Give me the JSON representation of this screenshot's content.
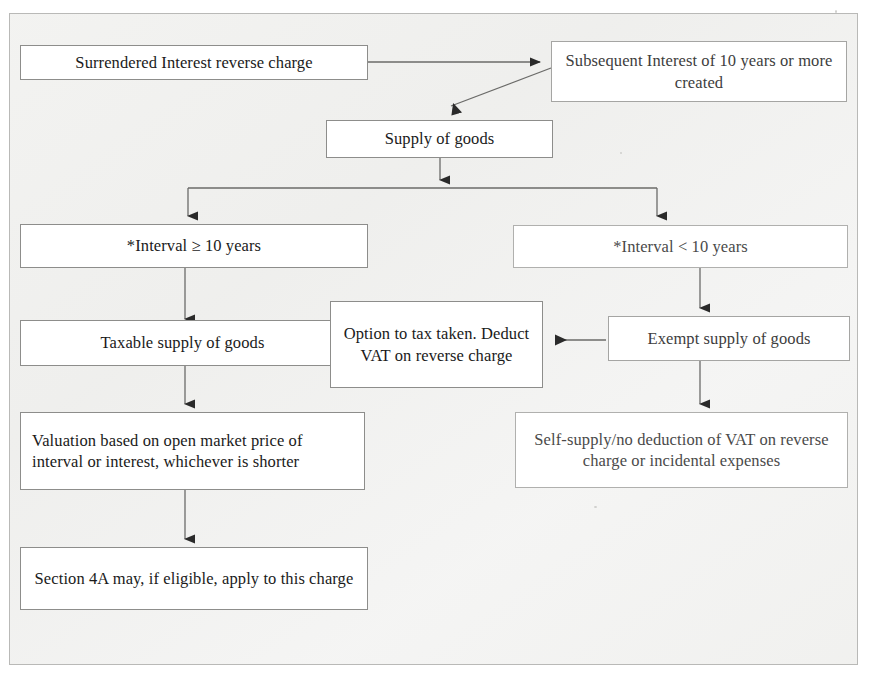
{
  "diagram": {
    "type": "flowchart",
    "orientation": "top-down",
    "nodes": [
      {
        "id": "surrendered-interest",
        "label": "Surrendered Interest reverse charge"
      },
      {
        "id": "subsequent-interest",
        "label": "Subsequent Interest of 10 years or more created"
      },
      {
        "id": "supply-of-goods",
        "label": "Supply of goods"
      },
      {
        "id": "interval-ge-10",
        "label": "*Interval ≥ 10 years"
      },
      {
        "id": "interval-lt-10",
        "label": "*Interval < 10 years"
      },
      {
        "id": "taxable-supply",
        "label": "Taxable supply of goods"
      },
      {
        "id": "option-to-tax",
        "label": "Option to tax taken. Deduct VAT on reverse charge"
      },
      {
        "id": "exempt-supply",
        "label": "Exempt supply of goods"
      },
      {
        "id": "valuation",
        "label": "Valuation based on open market price of interval or interest, whichever is shorter"
      },
      {
        "id": "self-supply",
        "label": "Self-supply/no deduction of VAT on reverse charge or incidental expenses"
      },
      {
        "id": "section-4a",
        "label": "Section 4A may, if eligible, apply to this charge"
      }
    ],
    "edges": [
      {
        "from": "surrendered-interest",
        "to": "subsequent-interest",
        "direction": "right"
      },
      {
        "from": "subsequent-interest",
        "to": "supply-of-goods",
        "direction": "down-left"
      },
      {
        "from": "supply-of-goods",
        "to": "interval-ge-10",
        "direction": "down-branch-left"
      },
      {
        "from": "supply-of-goods",
        "to": "interval-lt-10",
        "direction": "down-branch-right"
      },
      {
        "from": "interval-ge-10",
        "to": "taxable-supply",
        "direction": "down"
      },
      {
        "from": "interval-lt-10",
        "to": "exempt-supply",
        "direction": "down"
      },
      {
        "from": "exempt-supply",
        "to": "option-to-tax",
        "direction": "left"
      },
      {
        "from": "option-to-tax",
        "to": "taxable-supply",
        "direction": "left"
      },
      {
        "from": "taxable-supply",
        "to": "valuation",
        "direction": "down"
      },
      {
        "from": "exempt-supply",
        "to": "self-supply",
        "direction": "down"
      },
      {
        "from": "valuation",
        "to": "section-4a",
        "direction": "down"
      }
    ],
    "colors": {
      "box_border": "#8d8d8b",
      "frame_border": "#b9b9b7",
      "connector": "#6b6b69",
      "text": "#1a1a1a",
      "page_background": "#ffffff",
      "paper_tint": "#f1f1ef"
    }
  }
}
